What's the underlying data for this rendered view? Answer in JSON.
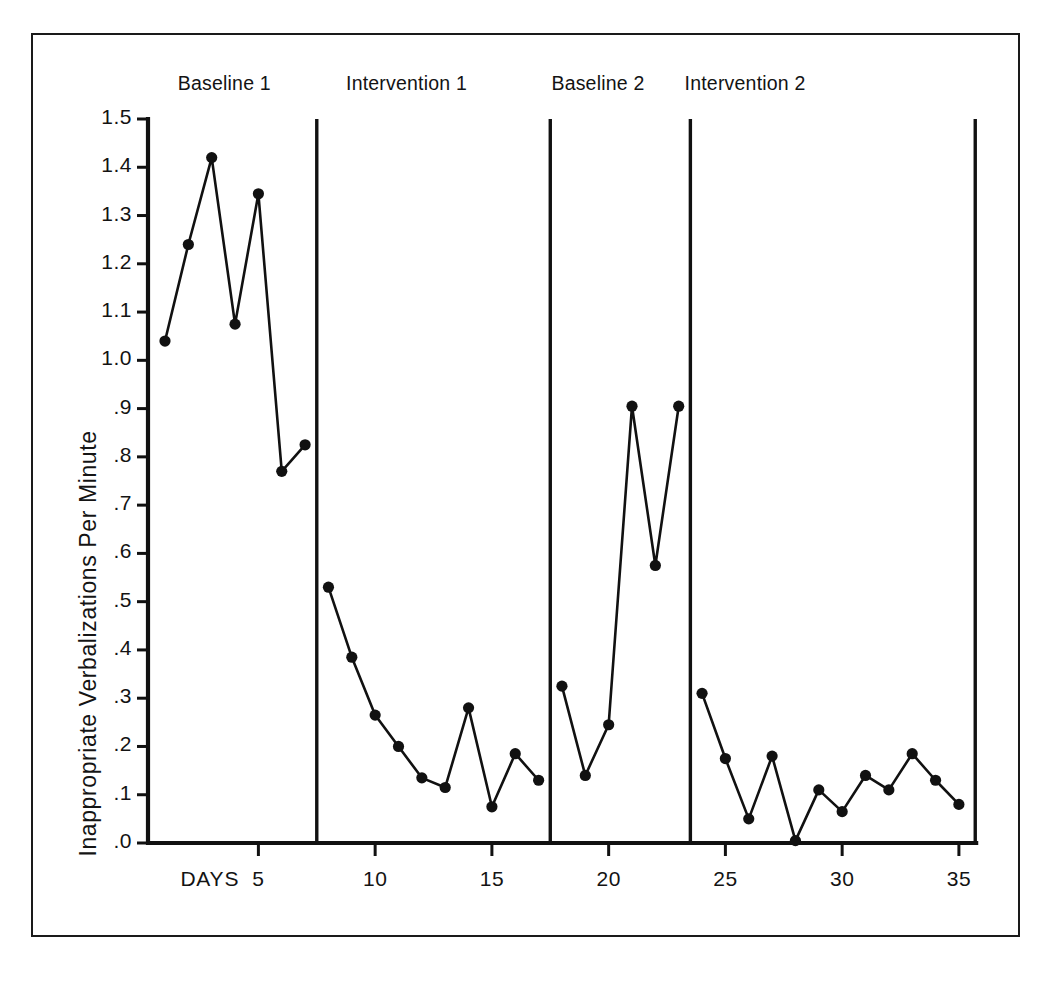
{
  "chart_data": {
    "type": "line",
    "title": "",
    "xlabel": "DAYS",
    "ylabel": "Inappropriate Verbalizations Per Minute",
    "xlim": [
      0,
      36.5
    ],
    "ylim": [
      0.0,
      1.5
    ],
    "grid": false,
    "legend": "none",
    "x_ticks": [
      5,
      10,
      15,
      20,
      25,
      30,
      35
    ],
    "x_tick_labels": [
      "5",
      "10",
      "15",
      "20",
      "25",
      "30",
      "35"
    ],
    "y_ticks": [
      0.0,
      0.1,
      0.2,
      0.3,
      0.4,
      0.5,
      0.6,
      0.7,
      0.8,
      0.9,
      1.0,
      1.1,
      1.2,
      1.3,
      1.4,
      1.5
    ],
    "y_tick_labels": [
      ".0",
      ".1",
      ".2",
      ".3",
      ".4",
      ".5",
      ".6",
      ".7",
      ".8",
      ".9",
      "1.0",
      "1.1",
      "1.2",
      "1.3",
      "1.4",
      "1.5"
    ],
    "marker": "filled-circle",
    "line_color": "#111111",
    "marker_color": "#111111",
    "phase_divider_days": [
      7.5,
      17.5,
      23.5,
      35.7
    ],
    "phases": [
      {
        "label": "Baseline 1",
        "label_day": 3.2,
        "x": [
          1,
          2,
          3,
          4,
          5,
          6,
          7
        ],
        "values": [
          1.04,
          1.24,
          1.42,
          1.075,
          1.345,
          0.77,
          0.825
        ]
      },
      {
        "label": "Intervention 1",
        "label_day": 11.0,
        "x": [
          8,
          9,
          10,
          11,
          12,
          13,
          14,
          15,
          16,
          17
        ],
        "values": [
          0.53,
          0.385,
          0.265,
          0.2,
          0.135,
          0.115,
          0.28,
          0.075,
          0.185,
          0.13
        ]
      },
      {
        "label": "Baseline 2",
        "label_day": 19.2,
        "x": [
          18,
          19,
          20,
          21,
          22,
          23
        ],
        "values": [
          0.325,
          0.14,
          0.245,
          0.905,
          0.575,
          0.905
        ]
      },
      {
        "label": "Intervention 2",
        "label_day": 25.5,
        "x": [
          24,
          25,
          26,
          27,
          28,
          29,
          30,
          31,
          32,
          33,
          34,
          35
        ],
        "values": [
          0.31,
          0.175,
          0.05,
          0.18,
          0.005,
          0.11,
          0.065,
          0.14,
          0.11,
          0.185,
          0.13,
          0.08
        ]
      }
    ]
  },
  "figure": {
    "border_color": "#1a1a1a",
    "background": "#ffffff",
    "axis_color": "#111111"
  }
}
